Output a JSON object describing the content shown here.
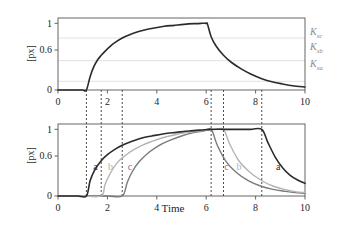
{
  "chart_data": [
    {
      "type": "line",
      "panel": "top",
      "title": "",
      "xlabel": "",
      "ylabel": "[p_x]",
      "ylabel_display": "[px]",
      "xlim": [
        0,
        10
      ],
      "ylim": [
        0,
        1.08
      ],
      "xticks": [
        0,
        2,
        4,
        6,
        8,
        10
      ],
      "xticklabels": [
        "0",
        "2",
        "4",
        "6",
        "8",
        "10"
      ],
      "yticks": [
        0,
        0.6,
        1
      ],
      "yticklabels": [
        "0",
        "0.6",
        "1"
      ],
      "grid": true,
      "gridlines_y": [
        0.13,
        0.44,
        0.78
      ],
      "legend": "none",
      "annotations": [
        {
          "text": "Kxc",
          "base": "K",
          "sub": "xc",
          "y": 0.78,
          "color": "#8a8a8a"
        },
        {
          "text": "Kxb",
          "base": "K",
          "sub": "xb",
          "y": 0.56,
          "color": "#8a8a8a"
        },
        {
          "text": "Kxa",
          "base": "K",
          "sub": "xa",
          "y": 0.3,
          "color": "#8a8a8a"
        }
      ],
      "vlines": [
        1.15,
        1.75,
        2.6,
        6.2,
        6.7,
        8.25
      ],
      "series": [
        {
          "name": "px",
          "color": "#2b2b2b",
          "x": [
            0,
            0.2,
            0.4,
            0.6,
            0.8,
            1.0,
            1.15,
            1.3,
            1.45,
            1.6,
            1.75,
            1.9,
            2.1,
            2.3,
            2.6,
            2.9,
            3.2,
            3.5,
            3.9,
            4.3,
            4.7,
            5.1,
            5.5,
            5.8,
            6.0,
            6.05,
            6.2,
            6.4,
            6.7,
            7.0,
            7.4,
            7.8,
            8.25,
            8.7,
            9.1,
            9.5,
            10.0
          ],
          "y": [
            0.0,
            0.0,
            0.0,
            0.0,
            0.0,
            0.0,
            0.0,
            0.2,
            0.35,
            0.45,
            0.52,
            0.58,
            0.65,
            0.71,
            0.78,
            0.83,
            0.87,
            0.9,
            0.93,
            0.955,
            0.97,
            0.985,
            0.995,
            1.0,
            1.0,
            0.99,
            0.8,
            0.66,
            0.52,
            0.42,
            0.32,
            0.24,
            0.17,
            0.12,
            0.09,
            0.065,
            0.045
          ]
        }
      ]
    },
    {
      "type": "line",
      "panel": "bottom",
      "title": "",
      "xlabel": "Time",
      "ylabel": "[p_x]",
      "ylabel_display": "[px]",
      "xlim": [
        0,
        10
      ],
      "ylim": [
        0,
        1.08
      ],
      "xticks": [
        0,
        2,
        4,
        6,
        8,
        10
      ],
      "xticklabels": [
        "0",
        "2",
        "4",
        "6",
        "8",
        "10"
      ],
      "yticks": [
        0,
        0.6,
        1
      ],
      "yticklabels": [
        "0",
        "0.6",
        "1"
      ],
      "grid": false,
      "legend": "inline-labels",
      "vlines": [
        1.15,
        1.75,
        2.6,
        6.2,
        6.7,
        8.25
      ],
      "inline_labels": [
        {
          "text": "a",
          "x": 1.55,
          "y": 0.42,
          "color": "#2b2b2b"
        },
        {
          "text": "b",
          "x": 2.15,
          "y": 0.42,
          "color": "#b4b4b4"
        },
        {
          "text": "c",
          "x": 2.95,
          "y": 0.42,
          "color": "#7a7a7a"
        },
        {
          "text": "c",
          "x": 6.85,
          "y": 0.42,
          "color": "#7a7a7a"
        },
        {
          "text": "b",
          "x": 7.35,
          "y": 0.42,
          "color": "#b4b4b4"
        },
        {
          "text": "a",
          "x": 8.95,
          "y": 0.42,
          "color": "#2b2b2b"
        }
      ],
      "series": [
        {
          "name": "a",
          "color": "#2b2b2b",
          "onset": 1.15,
          "offset": 8.25,
          "x": [
            0,
            0.4,
            0.8,
            1.15,
            1.3,
            1.5,
            1.75,
            2.0,
            2.3,
            2.6,
            3.0,
            3.4,
            3.8,
            4.3,
            4.8,
            5.3,
            5.8,
            6.2,
            6.7,
            7.2,
            7.8,
            8.25,
            8.5,
            8.8,
            9.1,
            9.4,
            9.7,
            10.0
          ],
          "y": [
            0.0,
            0.0,
            0.0,
            0.0,
            0.23,
            0.4,
            0.53,
            0.62,
            0.7,
            0.76,
            0.82,
            0.87,
            0.9,
            0.935,
            0.955,
            0.975,
            0.99,
            1.0,
            1.0,
            1.0,
            1.0,
            1.0,
            0.8,
            0.58,
            0.42,
            0.31,
            0.24,
            0.19
          ]
        },
        {
          "name": "b",
          "color": "#b4b4b4",
          "onset": 1.75,
          "offset": 6.7,
          "x": [
            0,
            0.5,
            1.0,
            1.75,
            1.9,
            2.1,
            2.4,
            2.7,
            3.0,
            3.4,
            3.8,
            4.2,
            4.7,
            5.2,
            5.7,
            6.1,
            6.4,
            6.7,
            6.95,
            7.3,
            7.7,
            8.2,
            8.7,
            9.2,
            9.6,
            10.0
          ],
          "y": [
            0.0,
            0.0,
            0.0,
            0.0,
            0.17,
            0.33,
            0.5,
            0.6,
            0.68,
            0.76,
            0.82,
            0.87,
            0.915,
            0.95,
            0.975,
            0.99,
            1.0,
            1.0,
            0.78,
            0.54,
            0.38,
            0.24,
            0.15,
            0.095,
            0.065,
            0.05
          ]
        },
        {
          "name": "c",
          "color": "#7a7a7a",
          "onset": 2.6,
          "offset": 6.2,
          "x": [
            0,
            0.6,
            1.2,
            2.0,
            2.6,
            2.8,
            3.0,
            3.3,
            3.7,
            4.1,
            4.5,
            5.0,
            5.5,
            5.9,
            6.2,
            6.45,
            6.8,
            7.2,
            7.7,
            8.2,
            8.7,
            9.2,
            9.6,
            10.0
          ],
          "y": [
            0.0,
            0.0,
            0.0,
            0.0,
            0.0,
            0.2,
            0.36,
            0.52,
            0.66,
            0.76,
            0.83,
            0.9,
            0.95,
            0.975,
            1.0,
            0.76,
            0.52,
            0.36,
            0.23,
            0.15,
            0.1,
            0.07,
            0.05,
            0.04
          ]
        }
      ]
    }
  ],
  "colors": {
    "axis": "#555555",
    "text": "#1e1e1e",
    "grid": "#e2e2e2",
    "curve_a": "#2b2b2b",
    "curve_b": "#b4b4b4",
    "curve_c": "#7a7a7a",
    "klabel": "#8a8a8a",
    "dashed": "#1e1e1e"
  },
  "top_panel": {
    "ylabel": "[px]",
    "yticks": [
      "1",
      "0.6",
      "0"
    ],
    "xticks": [
      "0",
      "2",
      "4",
      "6",
      "8",
      "10"
    ],
    "k_labels": [
      "Kxc",
      "Kxb",
      "Kxa"
    ]
  },
  "bottom_panel": {
    "ylabel": "[px]",
    "yticks": [
      "1",
      "0.6",
      "0"
    ],
    "xticks": [
      "0",
      "2",
      "4",
      "6",
      "8",
      "10"
    ],
    "xaxis_title": "Time",
    "curve_labels_left": [
      "a",
      "b",
      "c"
    ],
    "curve_labels_right": [
      "c",
      "b",
      "a"
    ]
  }
}
